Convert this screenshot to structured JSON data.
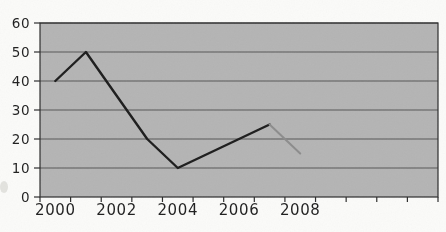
{
  "page": {
    "background_color": "#fbfbf9"
  },
  "chart_data": {
    "type": "line",
    "title": "",
    "legend": "none",
    "grid": "horizontal",
    "plot_area_fill": "#b4b4b4",
    "grid_line_color": "#565656",
    "axis_line_color": "#2b2b2b",
    "tick_label_color": "#1e1e1e",
    "x_axis": {
      "labels": [
        "2000",
        "2002",
        "2004",
        "2006",
        "2008"
      ],
      "label_years": [
        2000,
        2002,
        2004,
        2006,
        2008
      ],
      "category_start_year": 2000,
      "category_end_year": 2012,
      "tick_interval_years": 1
    },
    "y_axis": {
      "min": 0,
      "max": 60,
      "tick_step": 10,
      "tick_labels": [
        "0",
        "10",
        "20",
        "30",
        "40",
        "50",
        "60"
      ]
    },
    "series": [
      {
        "name": "main-line",
        "color": "#1c1c1c",
        "stroke_width": 2.4,
        "points": [
          [
            2000,
            40
          ],
          [
            2001,
            50
          ],
          [
            2002,
            35
          ],
          [
            2003,
            20
          ],
          [
            2004,
            10
          ],
          [
            2005,
            15
          ],
          [
            2006,
            20
          ],
          [
            2007,
            25
          ]
        ]
      },
      {
        "name": "gray-segment",
        "color": "#8c8c8c",
        "stroke_width": 2,
        "points": [
          [
            2007,
            25
          ],
          [
            2008,
            15
          ]
        ]
      }
    ]
  }
}
